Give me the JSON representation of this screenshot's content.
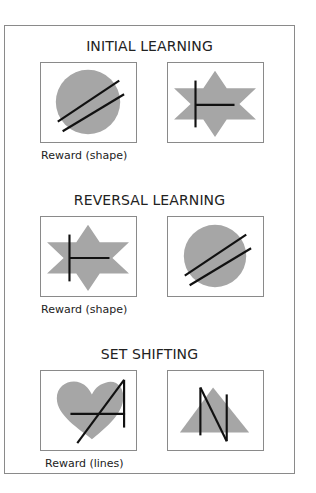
{
  "colors": {
    "shape_fill": "#a6a6a6",
    "line_stroke": "#111111",
    "border": "#8a8a8a",
    "text": "#222222"
  },
  "sections": [
    {
      "title": "INITIAL LEARNING",
      "caption": "Reward (shape)",
      "left_stimulus": {
        "shape": "circle",
        "lines": "two-parallel-diagonals"
      },
      "right_stimulus": {
        "shape": "six-point-star",
        "lines": "vertical-with-horizontal"
      }
    },
    {
      "title": "REVERSAL LEARNING",
      "caption": "Reward (shape)",
      "left_stimulus": {
        "shape": "six-point-star",
        "lines": "vertical-with-horizontal"
      },
      "right_stimulus": {
        "shape": "circle",
        "lines": "two-parallel-diagonals"
      }
    },
    {
      "title": "SET SHIFTING",
      "caption": "Reward (lines)",
      "left_stimulus": {
        "shape": "heart",
        "lines": "A-shaped"
      },
      "right_stimulus": {
        "shape": "triangle",
        "lines": "N-shaped"
      }
    }
  ]
}
